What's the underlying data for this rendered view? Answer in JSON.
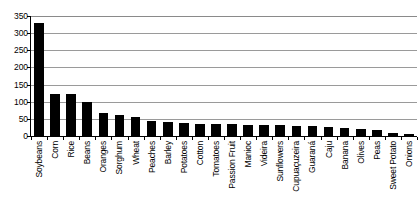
{
  "chart_data": {
    "type": "bar",
    "title": "",
    "subtitle": "",
    "xlabel": "",
    "ylabel": "",
    "ylim": [
      0,
      350
    ],
    "ytick_step": 50,
    "yticks": [
      0,
      50,
      100,
      150,
      200,
      250,
      300,
      350
    ],
    "ytick_labels": [
      "0",
      "50",
      "100",
      "150",
      "200",
      "250",
      "300",
      "350"
    ],
    "grid": true,
    "grid_axis": "y",
    "legend": false,
    "legend_position": "none",
    "bar_color": "#000000",
    "categories": [
      "Soybeans",
      "Corn",
      "Rice",
      "Beans",
      "Oranges",
      "Sorghum",
      "Wheat",
      "Peaches",
      "Barley",
      "Potatoes",
      "Cotton",
      "Tomatoes",
      "Passion Fruit",
      "Manioc",
      "Videira",
      "Sunflowers",
      "Cupuaçuzeira",
      "Guaraná",
      "Caju",
      "Banana",
      "Olives",
      "Peas",
      "Sweet Potato",
      "Onions"
    ],
    "values": [
      330,
      122,
      122,
      100,
      68,
      60,
      55,
      44,
      40,
      38,
      36,
      35,
      34,
      33,
      32,
      31,
      30,
      28,
      25,
      22,
      20,
      18,
      9,
      6
    ]
  }
}
